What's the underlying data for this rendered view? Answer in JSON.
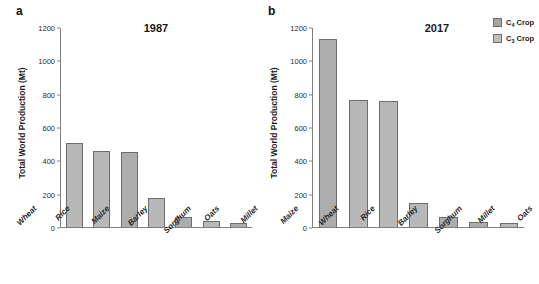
{
  "figure": {
    "background": "#ffffff",
    "legend": {
      "position": "top-right",
      "items": [
        {
          "label_prefix": "C",
          "label_sub": "4",
          "label_suffix": " Crop",
          "full_label": "C4 Crop",
          "swatch_color": "#a5a5a5",
          "photosynthesis": "c4"
        },
        {
          "label_prefix": "C",
          "label_sub": "3",
          "label_suffix": " Crop",
          "full_label": "C3 Crop",
          "swatch_color": "#bdbdbd",
          "photosynthesis": "c3"
        }
      ]
    }
  },
  "panels": [
    {
      "letter": "a",
      "title": "1987",
      "ylabel": "Total World Production (Mt)"
    },
    {
      "letter": "b",
      "title": "2017",
      "ylabel": "Total World Production (Mt)"
    }
  ],
  "chart_data": [
    {
      "type": "bar",
      "title": "1987",
      "panel": "a",
      "xlabel": "",
      "ylabel": "Total World Production (Mt)",
      "ylim": [
        0,
        1200
      ],
      "yticks": [
        0,
        200,
        400,
        600,
        800,
        1000,
        1200
      ],
      "grid": false,
      "legend_position": "figure-top-right",
      "categories": [
        "Wheat",
        "Rice",
        "Maize",
        "Barley",
        "Sorghum",
        "Oats",
        "Millet"
      ],
      "values": [
        505,
        460,
        455,
        175,
        62,
        38,
        25
      ],
      "bar_types": [
        "c3",
        "c3",
        "c4",
        "c3",
        "c4",
        "c3",
        "c4"
      ],
      "bar_colors": [
        "#b8b8b8",
        "#b8b8b8",
        "#adadad",
        "#b8b8b8",
        "#adadad",
        "#b8b8b8",
        "#adadad"
      ]
    },
    {
      "type": "bar",
      "title": "2017",
      "panel": "b",
      "xlabel": "",
      "ylabel": "Total World Production (Mt)",
      "ylim": [
        0,
        1200
      ],
      "yticks": [
        0,
        200,
        400,
        600,
        800,
        1000,
        1200
      ],
      "grid": false,
      "legend_position": "figure-top-right",
      "categories": [
        "Maize",
        "Wheat",
        "Rice",
        "Barley",
        "Sorghum",
        "Millet",
        "Oats"
      ],
      "values": [
        1135,
        765,
        760,
        145,
        58,
        28,
        23
      ],
      "bar_types": [
        "c4",
        "c3",
        "c3",
        "c3",
        "c4",
        "c4",
        "c3"
      ],
      "bar_colors": [
        "#adadad",
        "#b8b8b8",
        "#b8b8b8",
        "#b8b8b8",
        "#adadad",
        "#adadad",
        "#b8b8b8"
      ]
    }
  ]
}
